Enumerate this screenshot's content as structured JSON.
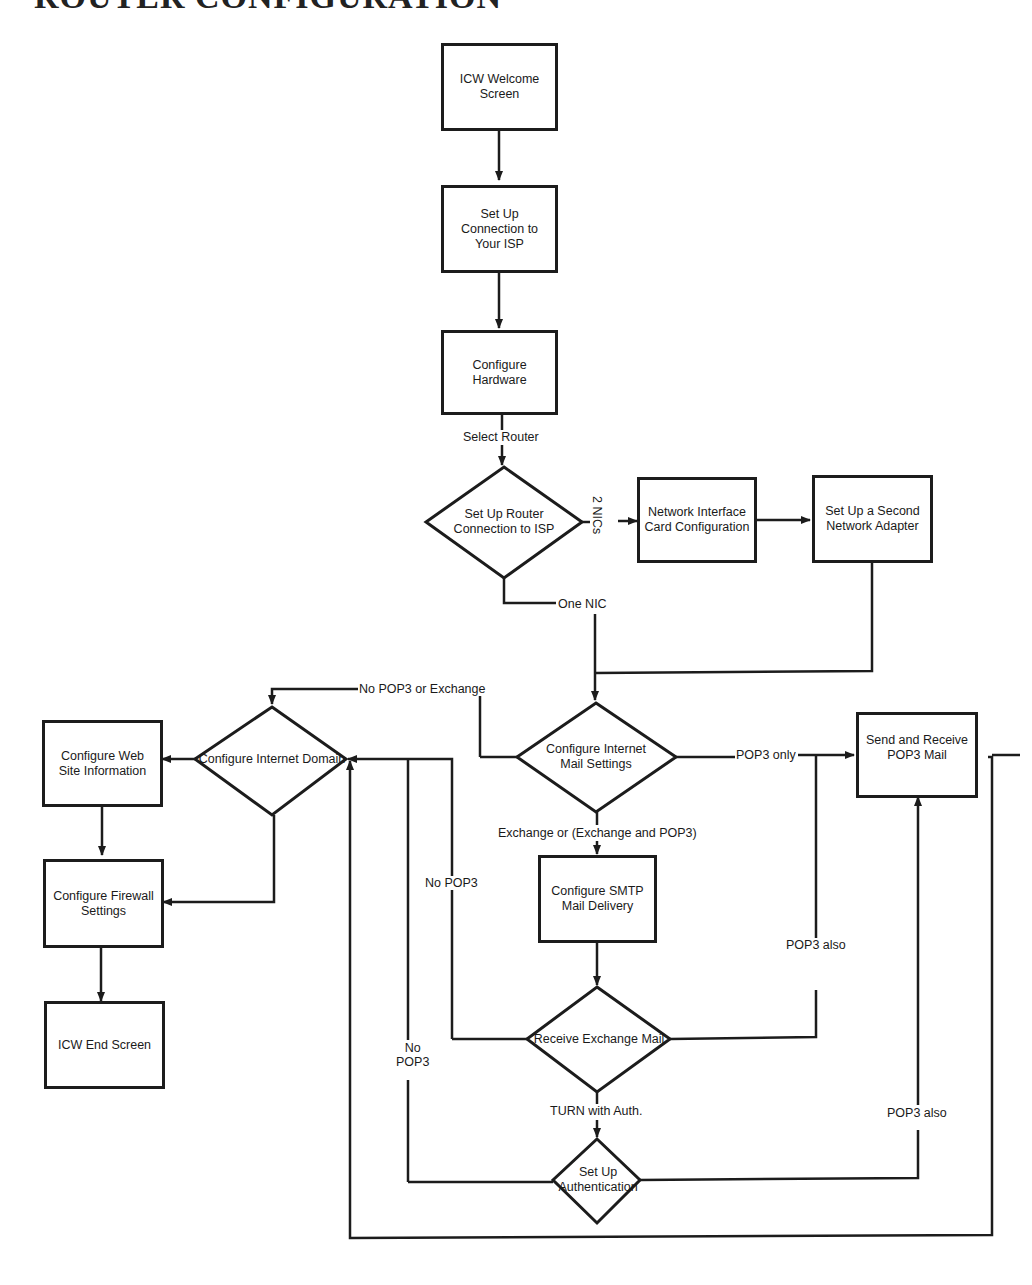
{
  "title": "ROUTER CONFIGURATION",
  "nodes": {
    "welcome": "ICW Welcome Screen",
    "isp_connection": "Set Up Connection to Your ISP",
    "hardware": "Configure Hardware",
    "router_connection": "Set Up Router Connection to ISP",
    "nic_config": "Network Interface Card Configuration",
    "second_adapter": "Set Up a Second Network Adapter",
    "mail_settings": "Configure Internet Mail Settings",
    "internet_domain": "Configure Internet Domain",
    "web_site": "Configure Web Site Information",
    "firewall": "Configure Firewall Settings",
    "end_screen": "ICW End Screen",
    "smtp": "Configure SMTP Mail Delivery",
    "pop3_mail": "Send and Receive POP3 Mail",
    "receive_exchange": "Receive Exchange Mail",
    "authentication": "Set Up Authentication"
  },
  "edge_labels": {
    "select_router": "Select Router",
    "two_nics": "2 NICs",
    "one_nic": "One NIC",
    "no_pop3_or_exchange": "No POP3 or Exchange",
    "pop3_only": "POP3 only",
    "exchange_or": "Exchange or (Exchange and POP3)",
    "no_pop3_a": "No POP3",
    "no_pop3_b": "No POP3",
    "pop3_also_a": "POP3 also",
    "pop3_also_b": "POP3 also",
    "turn_with_auth": "TURN with Auth."
  },
  "colors": {
    "stroke": "#1c1c1c",
    "background": "#ffffff"
  }
}
